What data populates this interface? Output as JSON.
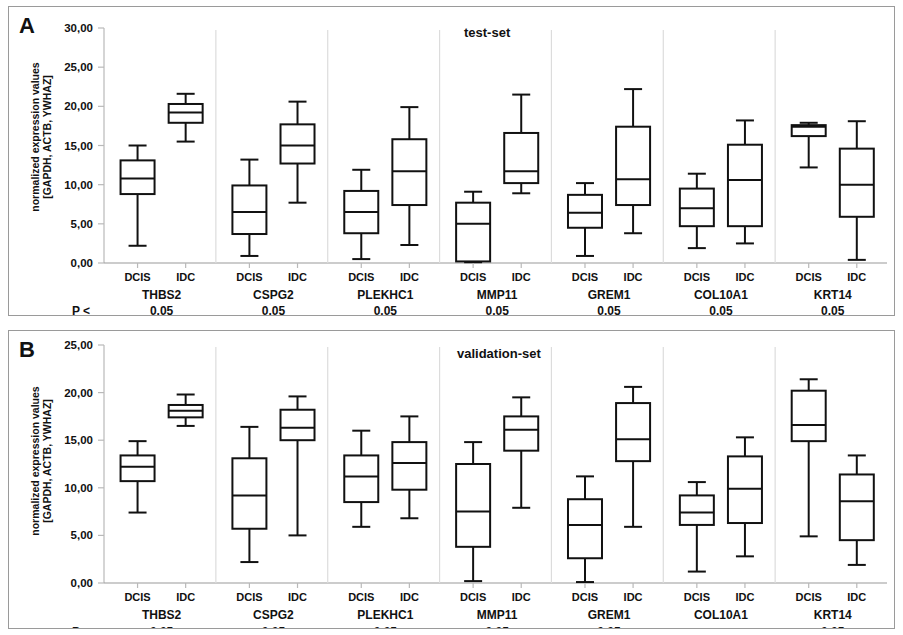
{
  "figure": {
    "ylabel_line1": "normalized expression values",
    "ylabel_line2": "[GAPDH, ACTB, YWHAZ]",
    "p_prefix": "P <",
    "group_dcis": "DCIS",
    "group_idc": "IDC"
  },
  "panels": [
    {
      "letter": "A",
      "title": "test-set",
      "ylabel_line1": "normalized expression values",
      "ylabel_line2": "[GAPDH, ACTB, YWHAZ]",
      "yticks": [
        "0,00",
        "5,00",
        "10,00",
        "15,00",
        "20,00",
        "25,00",
        "30,00"
      ]
    },
    {
      "letter": "B",
      "title": "validation-set",
      "ylabel_line1": "normalized expression values",
      "ylabel_line2": "[GAPDH, ACTB, YWHAZ]",
      "yticks": [
        "0,00",
        "5,00",
        "10,00",
        "15,00",
        "20,00",
        "25,00"
      ]
    }
  ],
  "chart_data": [
    {
      "type": "box",
      "panel": "A",
      "title": "test-set",
      "ylabel": "normalized expression values [GAPDH, ACTB, YWHAZ]",
      "xlabel": "",
      "ylim": [
        0,
        30
      ],
      "yticks": [
        0,
        5,
        10,
        15,
        20,
        25,
        30
      ],
      "ytick_labels": [
        "0,00",
        "5,00",
        "10,00",
        "15,00",
        "20,00",
        "25,00",
        "30,00"
      ],
      "grid": false,
      "legend": "none",
      "groups": [
        "DCIS",
        "IDC"
      ],
      "genes": [
        {
          "name": "THBS2",
          "p": "0.05",
          "DCIS": {
            "min": 2.2,
            "q1": 8.8,
            "median": 10.8,
            "q3": 13.1,
            "max": 15.0
          },
          "IDC": {
            "min": 15.5,
            "q1": 17.9,
            "median": 19.2,
            "q3": 20.3,
            "max": 21.6
          }
        },
        {
          "name": "CSPG2",
          "p": "0.05",
          "DCIS": {
            "min": 0.9,
            "q1": 3.7,
            "median": 6.5,
            "q3": 9.9,
            "max": 13.2
          },
          "IDC": {
            "min": 7.7,
            "q1": 12.7,
            "median": 15.0,
            "q3": 17.7,
            "max": 20.6
          }
        },
        {
          "name": "PLEKHC1",
          "p": "0.05",
          "DCIS": {
            "min": 0.5,
            "q1": 3.8,
            "median": 6.5,
            "q3": 9.2,
            "max": 11.9
          },
          "IDC": {
            "min": 2.3,
            "q1": 7.4,
            "median": 11.7,
            "q3": 15.8,
            "max": 19.9
          }
        },
        {
          "name": "MMP11",
          "p": "0.05",
          "DCIS": {
            "min": 0.1,
            "q1": 0.2,
            "median": 5.0,
            "q3": 7.7,
            "max": 9.1
          },
          "IDC": {
            "min": 8.9,
            "q1": 10.2,
            "median": 11.7,
            "q3": 16.6,
            "max": 21.5
          }
        },
        {
          "name": "GREM1",
          "p": "0.05",
          "DCIS": {
            "min": 0.9,
            "q1": 4.5,
            "median": 6.4,
            "q3": 8.7,
            "max": 10.2
          },
          "IDC": {
            "min": 3.8,
            "q1": 7.4,
            "median": 10.7,
            "q3": 17.4,
            "max": 22.2
          }
        },
        {
          "name": "COL10A1",
          "p": "0.05",
          "DCIS": {
            "min": 1.9,
            "q1": 4.7,
            "median": 7.0,
            "q3": 9.5,
            "max": 11.4
          },
          "IDC": {
            "min": 2.5,
            "q1": 4.7,
            "median": 10.6,
            "q3": 15.1,
            "max": 18.2
          }
        },
        {
          "name": "KRT14",
          "p": "0.05",
          "DCIS": {
            "min": 12.2,
            "q1": 16.2,
            "median": 17.4,
            "q3": 17.6,
            "max": 17.9
          },
          "IDC": {
            "min": 0.4,
            "q1": 5.9,
            "median": 10.0,
            "q3": 14.6,
            "max": 18.1
          }
        }
      ]
    },
    {
      "type": "box",
      "panel": "B",
      "title": "validation-set",
      "ylabel": "normalized expression values [GAPDH, ACTB, YWHAZ]",
      "xlabel": "",
      "ylim": [
        0,
        25
      ],
      "yticks": [
        0,
        5,
        10,
        15,
        20,
        25
      ],
      "ytick_labels": [
        "0,00",
        "5,00",
        "10,00",
        "15,00",
        "20,00",
        "25,00"
      ],
      "grid": false,
      "legend": "none",
      "groups": [
        "DCIS",
        "IDC"
      ],
      "genes": [
        {
          "name": "THBS2",
          "p": "0.05",
          "DCIS": {
            "min": 7.4,
            "q1": 10.7,
            "median": 12.2,
            "q3": 13.4,
            "max": 14.9
          },
          "IDC": {
            "min": 16.5,
            "q1": 17.4,
            "median": 18.1,
            "q3": 18.7,
            "max": 19.8
          }
        },
        {
          "name": "CSPG2",
          "p": "0.05",
          "DCIS": {
            "min": 2.2,
            "q1": 5.7,
            "median": 9.2,
            "q3": 13.1,
            "max": 16.4
          },
          "IDC": {
            "min": 5.0,
            "q1": 15.0,
            "median": 16.3,
            "q3": 18.2,
            "max": 19.6
          }
        },
        {
          "name": "PLEKHC1",
          "p": "0.05",
          "DCIS": {
            "min": 5.9,
            "q1": 8.5,
            "median": 11.2,
            "q3": 13.4,
            "max": 16.0
          },
          "IDC": {
            "min": 6.8,
            "q1": 9.8,
            "median": 12.6,
            "q3": 14.8,
            "max": 17.5
          }
        },
        {
          "name": "MMP11",
          "p": "0.05",
          "DCIS": {
            "min": 0.2,
            "q1": 3.8,
            "median": 7.5,
            "q3": 12.5,
            "max": 14.8
          },
          "IDC": {
            "min": 7.9,
            "q1": 13.9,
            "median": 16.1,
            "q3": 17.5,
            "max": 19.5
          }
        },
        {
          "name": "GREM1",
          "p": "0.05",
          "DCIS": {
            "min": 0.1,
            "q1": 2.6,
            "median": 6.1,
            "q3": 8.8,
            "max": 11.2
          },
          "IDC": {
            "min": 5.9,
            "q1": 12.8,
            "median": 15.1,
            "q3": 18.9,
            "max": 20.6
          }
        },
        {
          "name": "COL10A1",
          "p": "n.s.",
          "DCIS": {
            "min": 1.2,
            "q1": 6.1,
            "median": 7.4,
            "q3": 9.2,
            "max": 10.6
          },
          "IDC": {
            "min": 2.8,
            "q1": 6.3,
            "median": 9.9,
            "q3": 13.3,
            "max": 15.3
          }
        },
        {
          "name": "KRT14",
          "p": "0.05",
          "DCIS": {
            "min": 4.9,
            "q1": 14.9,
            "median": 16.6,
            "q3": 20.2,
            "max": 21.4
          },
          "IDC": {
            "min": 1.9,
            "q1": 4.5,
            "median": 8.6,
            "q3": 11.4,
            "max": 13.4
          }
        }
      ]
    }
  ]
}
